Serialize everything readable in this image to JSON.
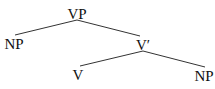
{
  "tree": {
    "nodes": [
      {
        "id": "vp",
        "label": "VP",
        "x": 77,
        "y": 7
      },
      {
        "id": "np-subject",
        "label": "NP",
        "x": 14,
        "y": 37
      },
      {
        "id": "v-bar",
        "label": "V′",
        "x": 143,
        "y": 38
      },
      {
        "id": "v",
        "label": "V",
        "x": 78,
        "y": 68
      },
      {
        "id": "np-object",
        "label": "NP",
        "x": 204,
        "y": 69
      }
    ],
    "edges": [
      {
        "from": "vp",
        "to": "np-subject",
        "x1": 77,
        "y1": 20,
        "x2": 15,
        "y2": 35
      },
      {
        "from": "vp",
        "to": "v-bar",
        "x1": 77,
        "y1": 20,
        "x2": 140,
        "y2": 36
      },
      {
        "from": "v-bar",
        "to": "v",
        "x1": 143,
        "y1": 51,
        "x2": 80,
        "y2": 66
      },
      {
        "from": "v-bar",
        "to": "np-object",
        "x1": 143,
        "y1": 51,
        "x2": 205,
        "y2": 67
      }
    ],
    "line_color": "#333333",
    "text_color": "#111111"
  }
}
